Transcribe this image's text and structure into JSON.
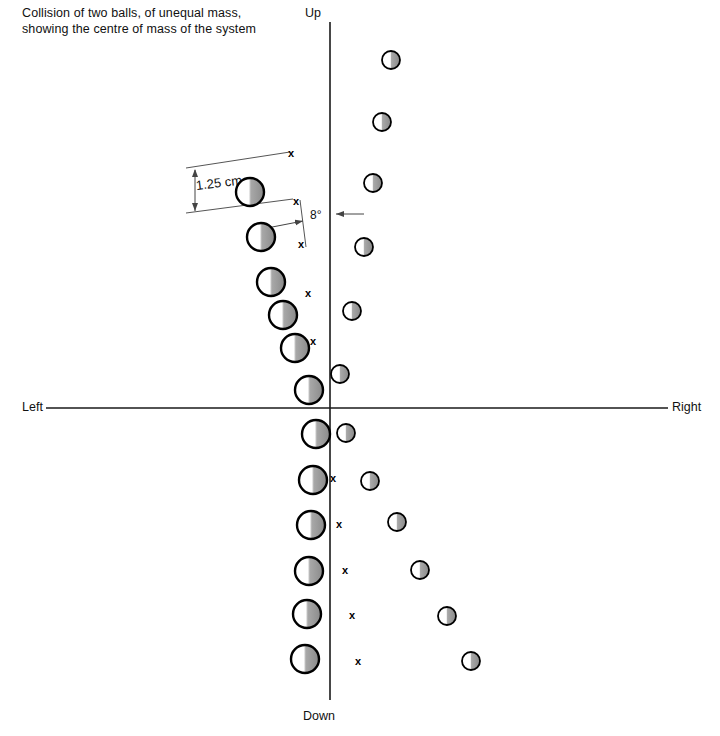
{
  "caption": "Collision of two balls, of unequal mass, showing the centre of mass of the system",
  "axes": {
    "up_label": "Up",
    "down_label": "Down",
    "left_label": "Left",
    "right_label": "Right",
    "vertical_x": 330,
    "horizontal_y": 408,
    "color": "#1a1a1a"
  },
  "annotations": {
    "scale_label": "1.25 cm",
    "angle_label": "8°"
  },
  "colors": {
    "outline": "#000000",
    "ball_light": "#ffffff",
    "ball_shade": "#8c8c8c",
    "axis": "#1a1a1a",
    "mark": "#000000",
    "leader": "#555555"
  },
  "chart_data": {
    "type": "scatter",
    "title": "Collision of two balls, of unequal mass, showing the centre of mass of the system",
    "xlabel": "Left — Right",
    "ylabel": "Up — Down",
    "xlim": [
      0,
      720
    ],
    "ylim": [
      0,
      736
    ],
    "grid": false,
    "legend": null,
    "origin": {
      "x": 330,
      "y": 408
    },
    "scale_annotation": {
      "label": "1.25 cm",
      "pixels": 46
    },
    "angle_annotation": {
      "label": "8°",
      "degrees": 8
    },
    "series": [
      {
        "name": "large-ball",
        "marker": "half-shaded-circle",
        "radius": 14,
        "points": [
          {
            "x": 250,
            "y": 192
          },
          {
            "x": 261,
            "y": 237
          },
          {
            "x": 271,
            "y": 282
          },
          {
            "x": 283,
            "y": 315
          },
          {
            "x": 295,
            "y": 348
          },
          {
            "x": 309,
            "y": 390
          },
          {
            "x": 316,
            "y": 434
          },
          {
            "x": 313,
            "y": 480
          },
          {
            "x": 311,
            "y": 525
          },
          {
            "x": 309,
            "y": 571
          },
          {
            "x": 307,
            "y": 614
          },
          {
            "x": 305,
            "y": 659
          }
        ]
      },
      {
        "name": "small-ball",
        "marker": "half-shaded-circle",
        "radius": 9,
        "points": [
          {
            "x": 391,
            "y": 60
          },
          {
            "x": 382,
            "y": 122
          },
          {
            "x": 373,
            "y": 183
          },
          {
            "x": 364,
            "y": 247
          },
          {
            "x": 352,
            "y": 311
          },
          {
            "x": 340,
            "y": 374
          },
          {
            "x": 346,
            "y": 433
          },
          {
            "x": 370,
            "y": 481
          },
          {
            "x": 397,
            "y": 522
          },
          {
            "x": 420,
            "y": 570
          },
          {
            "x": 447,
            "y": 616
          },
          {
            "x": 471,
            "y": 661
          }
        ]
      },
      {
        "name": "centre-of-mass",
        "marker": "x",
        "points": [
          {
            "x": 291,
            "y": 153
          },
          {
            "x": 296,
            "y": 201
          },
          {
            "x": 301,
            "y": 244
          },
          {
            "x": 308,
            "y": 293
          },
          {
            "x": 313,
            "y": 341
          },
          {
            "x": 333,
            "y": 478
          },
          {
            "x": 339,
            "y": 524
          },
          {
            "x": 345,
            "y": 570
          },
          {
            "x": 352,
            "y": 615
          },
          {
            "x": 358,
            "y": 661
          }
        ]
      }
    ]
  }
}
